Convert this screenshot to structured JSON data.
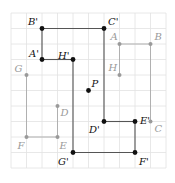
{
  "grid": {
    "origin_x": 11,
    "origin_y": 13,
    "cell": 15.5,
    "cols": 10,
    "rows": 10,
    "line_color": "#e2e2e2"
  },
  "colors": {
    "original": "#9a9a9a",
    "image": "#111111",
    "image_line": "#555555"
  },
  "original_polygon": {
    "name": "ABCDEFGH",
    "points": [
      {
        "label": "A",
        "col": 7,
        "row": 2
      },
      {
        "label": "B",
        "col": 9,
        "row": 2
      },
      {
        "label": "C",
        "col": 9,
        "row": 7
      },
      {
        "label": "D",
        "col": 3,
        "row": 6
      },
      {
        "label": "E",
        "col": 3,
        "row": 8
      },
      {
        "label": "F",
        "col": 1,
        "row": 8
      },
      {
        "label": "G",
        "col": 1,
        "row": 4
      },
      {
        "label": "H",
        "col": 7,
        "row": 4
      }
    ],
    "segments": [
      [
        "A",
        "B"
      ],
      [
        "B",
        "C"
      ],
      [
        "A",
        "H"
      ],
      [
        "D",
        "E"
      ],
      [
        "E",
        "F"
      ],
      [
        "F",
        "G"
      ]
    ]
  },
  "image_polygon": {
    "name": "A'B'C'D'E'F'G'H'",
    "points": [
      {
        "label": "A'",
        "col": 2,
        "row": 3
      },
      {
        "label": "B'",
        "col": 2,
        "row": 1
      },
      {
        "label": "C'",
        "col": 6,
        "row": 1
      },
      {
        "label": "D'",
        "col": 6,
        "row": 7
      },
      {
        "label": "E'",
        "col": 8,
        "row": 7
      },
      {
        "label": "F'",
        "col": 8,
        "row": 9
      },
      {
        "label": "G'",
        "col": 4,
        "row": 9
      },
      {
        "label": "H'",
        "col": 4,
        "row": 3
      }
    ],
    "segments": [
      [
        "A'",
        "B'"
      ],
      [
        "B'",
        "C'"
      ],
      [
        "C'",
        "D'"
      ],
      [
        "D'",
        "E'"
      ],
      [
        "E'",
        "F'"
      ],
      [
        "F'",
        "G'"
      ],
      [
        "G'",
        "H'"
      ],
      [
        "H'",
        "A'"
      ]
    ]
  },
  "center": {
    "label": "P",
    "col": 5,
    "row": 5
  }
}
